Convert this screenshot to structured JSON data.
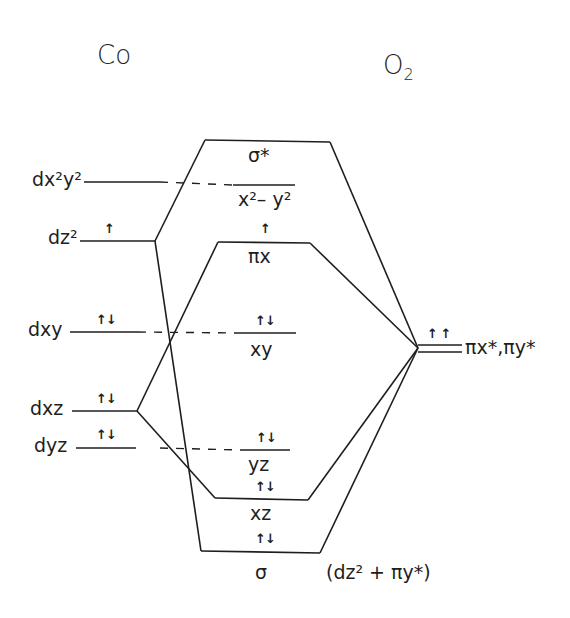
{
  "diagram": {
    "title_left": "Co",
    "title_right_main": "O",
    "title_right_sub": "2",
    "metal_orbitals": [
      {
        "label": "dx²y²",
        "electrons": ""
      },
      {
        "label": "dz²",
        "electrons": "↑"
      },
      {
        "label": "dxy",
        "electrons": "↑↓"
      },
      {
        "label": "dxz",
        "electrons": "↑↓"
      },
      {
        "label": "dyz",
        "electrons": "↑↓"
      }
    ],
    "mo_levels": [
      {
        "label": "σ*",
        "electrons": ""
      },
      {
        "label": "x²– y²",
        "electrons": ""
      },
      {
        "label": "πx",
        "electrons": "↑"
      },
      {
        "label": "xy",
        "electrons": "↑↓"
      },
      {
        "label": "yz",
        "electrons": "↑↓"
      },
      {
        "label": "xz",
        "electrons": "↑↓"
      },
      {
        "label": "σ",
        "electrons": "↑↓"
      }
    ],
    "ligand_orbital": {
      "label": "πx*,πy*",
      "electrons": "↑ ↑"
    },
    "sigma_annotation": "(dz² + πy*)"
  }
}
